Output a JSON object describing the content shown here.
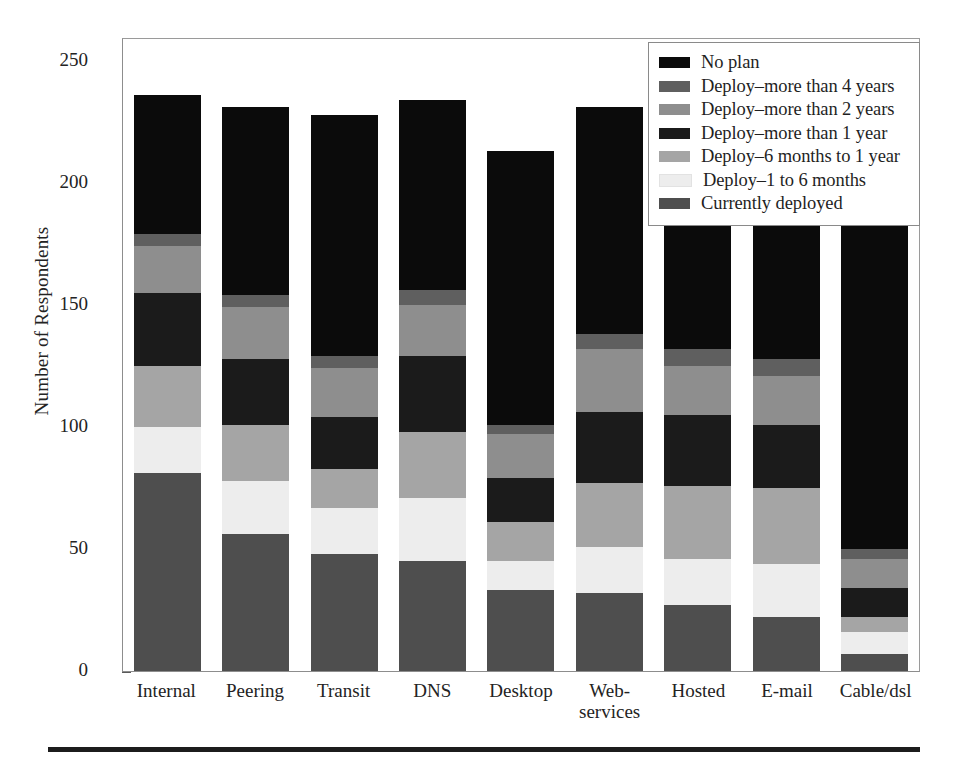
{
  "chart_data": {
    "type": "bar",
    "subtype": "stacked-bar",
    "title": "",
    "xlabel": "",
    "ylabel": "Number of Respondents",
    "ylim": [
      0,
      250
    ],
    "yticks": [
      0,
      50,
      100,
      150,
      200,
      250
    ],
    "grid": false,
    "legend_position": "top-right",
    "categories": [
      "Internal",
      "Peering",
      "Transit",
      "DNS",
      "Desktop",
      "Web-\nservices",
      "Hosted",
      "E-mail",
      "Cable/dsl"
    ],
    "series": [
      {
        "name": "Currently deployed",
        "color": "#4e4e4e",
        "values": [
          81,
          56,
          48,
          45,
          33,
          32,
          27,
          22,
          7
        ]
      },
      {
        "name": "Deploy–1 to 6 months",
        "color": "#ededed",
        "values": [
          19,
          22,
          19,
          26,
          12,
          19,
          19,
          22,
          9
        ]
      },
      {
        "name": "Deploy–6 months to 1 year",
        "color": "#a5a5a5",
        "values": [
          25,
          23,
          16,
          27,
          16,
          26,
          30,
          31,
          6
        ]
      },
      {
        "name": "Deploy–more than 1 year",
        "color": "#1b1b1b",
        "values": [
          30,
          27,
          21,
          31,
          18,
          29,
          29,
          26,
          12
        ]
      },
      {
        "name": "Deploy–more than 2 years",
        "color": "#8e8e8e",
        "values": [
          19,
          21,
          20,
          21,
          18,
          26,
          20,
          20,
          12
        ]
      },
      {
        "name": "Deploy–more than 4 years",
        "color": "#5f5f5f",
        "values": [
          5,
          5,
          5,
          6,
          4,
          6,
          7,
          7,
          4
        ]
      },
      {
        "name": "No plan",
        "color": "#0b0b0b",
        "values": [
          57,
          77,
          99,
          78,
          112,
          93,
          91,
          105,
          175
        ]
      }
    ],
    "totals": [
      236,
      231,
      228,
      234,
      213,
      231,
      223,
      233,
      225
    ]
  },
  "legend": {
    "items": [
      {
        "label": "No plan",
        "color": "#0b0b0b"
      },
      {
        "label": "Deploy–more than 4 years",
        "color": "#5f5f5f"
      },
      {
        "label": "Deploy–more than 2 years",
        "color": "#8e8e8e"
      },
      {
        "label": "Deploy–more than 1 year",
        "color": "#1b1b1b"
      },
      {
        "label": "Deploy–6 months to 1 year",
        "color": "#a5a5a5"
      },
      {
        "label": "Deploy–1 to 6 months",
        "color": "#ededed"
      },
      {
        "label": "Currently deployed",
        "color": "#4e4e4e"
      }
    ]
  }
}
